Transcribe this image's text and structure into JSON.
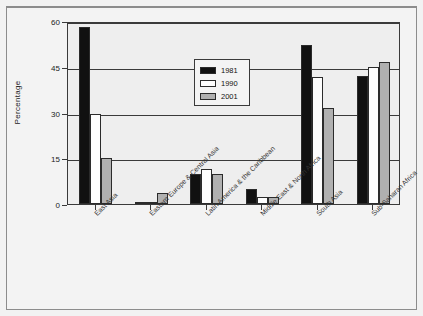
{
  "chart_data": {
    "type": "bar",
    "title": "",
    "xlabel": "",
    "ylabel": "Percentage",
    "ylim": [
      0,
      60
    ],
    "yticks": [
      0,
      15,
      30,
      45,
      60
    ],
    "grid": true,
    "legend_position": "upper-left-inside",
    "categories": [
      "East Asia",
      "Eastern Europe & Central Asia",
      "Latin America & the Caribbean",
      "Middle East & North Africa",
      "South Asia",
      "Sub-Saharan Africa"
    ],
    "series": [
      {
        "name": "1981",
        "color": "#111111",
        "values": [
          58,
          0.8,
          10,
          5,
          52,
          42
        ]
      },
      {
        "name": "1990",
        "color": "#ffffff",
        "values": [
          29.5,
          0.5,
          11.5,
          2.2,
          41.5,
          45
        ]
      },
      {
        "name": "2001",
        "color": "#b0b0b0",
        "values": [
          15,
          3.7,
          9.8,
          2.4,
          31.5,
          46.5
        ]
      }
    ]
  },
  "axis": {
    "y_title": "Percentage",
    "y_tick_labels": [
      "60",
      "45",
      "30",
      "15",
      "0"
    ]
  },
  "legend": {
    "items": [
      {
        "label": "1981",
        "swatch": "black-swatch"
      },
      {
        "label": "1990",
        "swatch": "white-swatch"
      },
      {
        "label": "2001",
        "swatch": "gray-swatch"
      }
    ]
  }
}
